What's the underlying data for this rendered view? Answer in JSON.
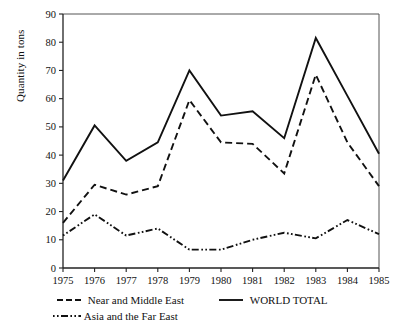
{
  "figure": {
    "top_cut_text": "",
    "background": "#ffffff",
    "ink": "#111111"
  },
  "axes": {
    "ylabel": "Quantity in tons",
    "yticks": [
      0,
      10,
      20,
      30,
      40,
      50,
      60,
      70,
      80,
      90
    ],
    "ylim": [
      0,
      90
    ],
    "xticks": [
      "1975",
      "1976",
      "1977",
      "1978",
      "1979",
      "1980",
      "1981",
      "1982",
      "1983",
      "1984",
      "1985"
    ],
    "xlabel": ""
  },
  "legend": {
    "entries": [
      {
        "label": "Near and Middle East",
        "style": "dashed"
      },
      {
        "label": "Asia and the Far East",
        "style": "dash-dot"
      },
      {
        "label": "WORLD TOTAL",
        "style": "solid"
      }
    ]
  },
  "chart_data": {
    "type": "line",
    "title": "",
    "subtitle": "",
    "xlabel": "",
    "ylabel": "Quantity in tons",
    "x": [
      1975,
      1976,
      1977,
      1978,
      1979,
      1980,
      1981,
      1982,
      1983,
      1984,
      1985
    ],
    "categories": [
      "1975",
      "1976",
      "1977",
      "1978",
      "1979",
      "1980",
      "1981",
      "1982",
      "1983",
      "1984",
      "1985"
    ],
    "xlim": [
      1975,
      1985
    ],
    "ylim": [
      0,
      90
    ],
    "ytick_step": 10,
    "grid": false,
    "legend_position": "below-axes",
    "series": [
      {
        "name": "WORLD TOTAL",
        "style": "solid",
        "color": "#111111",
        "values": [
          31,
          50.5,
          38,
          44.5,
          70,
          54,
          55.5,
          46,
          81.5,
          61,
          40.5
        ]
      },
      {
        "name": "Near and Middle East",
        "style": "dashed",
        "color": "#111111",
        "values": [
          16,
          29.5,
          26,
          29,
          59.5,
          44.5,
          44,
          33.5,
          68.5,
          44.5,
          29
        ]
      },
      {
        "name": "Asia and the Far East",
        "style": "dash-dot",
        "color": "#111111",
        "values": [
          11.5,
          19,
          11.5,
          14,
          6.5,
          6.5,
          10,
          12.5,
          10.5,
          17,
          12
        ]
      }
    ],
    "annotations": [
      {
        "text": "1979 world-total peak",
        "x": 1979,
        "y": 70
      },
      {
        "text": "1983 world-total peak",
        "x": 1983,
        "y": 81.5
      }
    ]
  }
}
